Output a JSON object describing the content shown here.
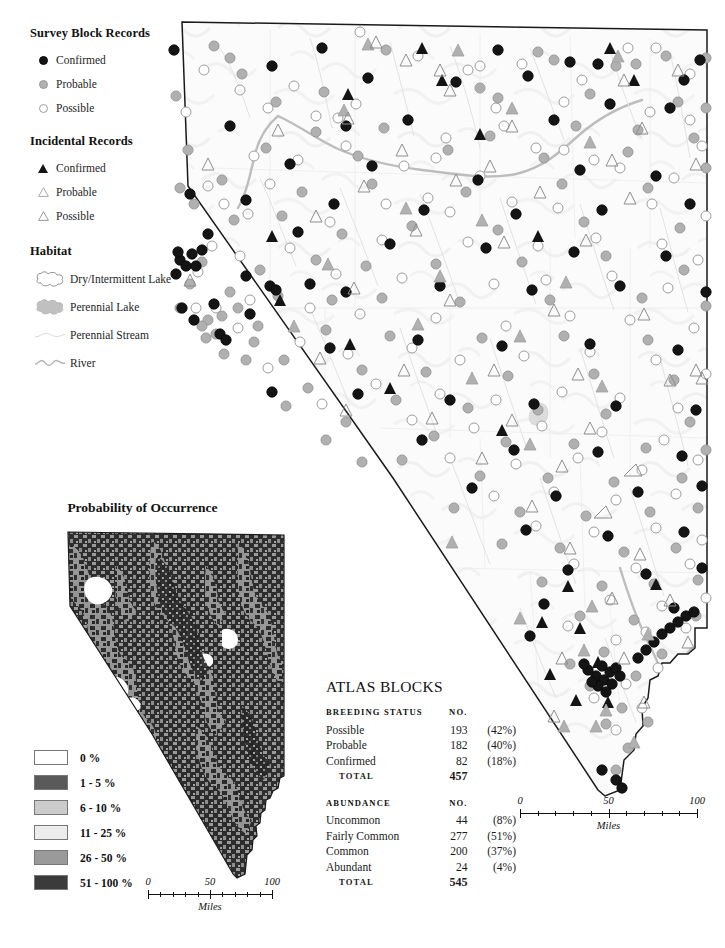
{
  "legend": {
    "sections": [
      {
        "title": "Survey Block Records",
        "items": [
          {
            "label": "Confirmed",
            "symbol": "filled-circle-icon"
          },
          {
            "label": "Probable",
            "symbol": "gray-circle-icon"
          },
          {
            "label": "Possible",
            "symbol": "open-circle-icon"
          }
        ]
      },
      {
        "title": "Incidental Records",
        "items": [
          {
            "label": "Confirmed",
            "symbol": "filled-triangle-icon"
          },
          {
            "label": "Probable",
            "symbol": "gray-triangle-icon"
          },
          {
            "label": "Possible",
            "symbol": "open-triangle-icon"
          }
        ]
      }
    ],
    "habitat": {
      "title": "Habitat",
      "items": [
        {
          "label": "Dry/Intermittent Lake",
          "symbol": "dry-lake-icon"
        },
        {
          "label": "Perennial Lake",
          "symbol": "perennial-lake-icon"
        },
        {
          "label": "Perennial Stream",
          "symbol": "perennial-stream-icon"
        },
        {
          "label": "River",
          "symbol": "river-icon"
        }
      ]
    }
  },
  "probability": {
    "title": "Probability of Occurrence",
    "legend": [
      {
        "label": "0 %",
        "color": "#ffffff"
      },
      {
        "label": "1 - 5 %",
        "color": "#5a5a5a"
      },
      {
        "label": "6 - 10 %",
        "color": "#cbcbcb"
      },
      {
        "label": "11 - 25 %",
        "color": "#ececec"
      },
      {
        "label": "26 - 50 %",
        "color": "#9a9a9a"
      },
      {
        "label": "51 - 100 %",
        "color": "#3b3b3b"
      }
    ]
  },
  "scale_small": {
    "ticks": [
      "0",
      "50",
      "100"
    ],
    "caption": "Miles"
  },
  "scale_main": {
    "ticks": [
      "0",
      "50",
      "100"
    ],
    "caption": "Miles"
  },
  "stats": {
    "title": "ATLAS BLOCKS",
    "blocks": [
      {
        "header": [
          "BREEDING STATUS",
          "NO."
        ],
        "rows": [
          {
            "label": "Possible",
            "no": "193",
            "pct": "(42%)"
          },
          {
            "label": "Probable",
            "no": "182",
            "pct": "(40%)"
          },
          {
            "label": "Confirmed",
            "no": "82",
            "pct": "(18%)"
          }
        ],
        "total": {
          "label": "TOTAL",
          "no": "457",
          "pct": ""
        }
      },
      {
        "header": [
          "ABUNDANCE",
          "NO."
        ],
        "rows": [
          {
            "label": "Uncommon",
            "no": "44",
            "pct": "(8%)"
          },
          {
            "label": "Fairly Common",
            "no": "277",
            "pct": "(51%)"
          },
          {
            "label": "Common",
            "no": "200",
            "pct": "(37%)"
          },
          {
            "label": "Abundant",
            "no": "24",
            "pct": "(4%)"
          }
        ],
        "total": {
          "label": "TOTAL",
          "no": "545",
          "pct": ""
        }
      }
    ]
  },
  "colors": {
    "confirmed": "#141414",
    "probable": "#b0b0b0",
    "possible": "#ffffff",
    "map_fill": "#fbfbfb",
    "map_border": "#1a1a1a",
    "water": "#b9b9b9"
  }
}
